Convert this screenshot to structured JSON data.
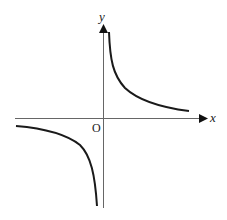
{
  "diagram": {
    "type": "function-graph",
    "axes": {
      "x_label": "x",
      "y_label": "y",
      "origin_label": "O"
    },
    "colors": {
      "axis": "#555555",
      "curve": "#1a1a1a",
      "background": "#ffffff"
    },
    "branches": [
      {
        "name": "first-quadrant-branch",
        "quadrant": "I"
      },
      {
        "name": "third-quadrant-branch",
        "quadrant": "III"
      }
    ]
  }
}
